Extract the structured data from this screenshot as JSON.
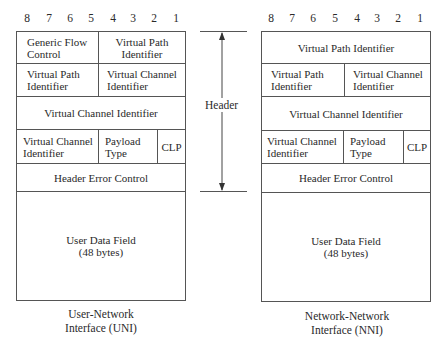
{
  "bit_labels": [
    "8",
    "7",
    "6",
    "5",
    "4",
    "3",
    "2",
    "1"
  ],
  "header_annotation": {
    "label": "Header"
  },
  "uni": {
    "caption_line1": "User-Network",
    "caption_line2": "Interface (UNI)",
    "rows": {
      "r1_left": "Generic Flow Control",
      "r1_right": "Virtual Path Identifier",
      "r2_left": "Virtual Path Identifier",
      "r2_right": "Virtual Channel Identifier",
      "r3": "Virtual Channel Identifier",
      "r4_left": "Virtual Channel Identifier",
      "r4_mid": "Payload Type",
      "r4_right": "CLP",
      "r5": "Header Error Control",
      "data_line1": "User Data Field",
      "data_line2": "(48 bytes)"
    }
  },
  "nni": {
    "caption_line1": "Network-Network",
    "caption_line2": "Interface (NNI)",
    "rows": {
      "r1": "Virtual Path Identifier",
      "r2_left": "Virtual Path Identifier",
      "r2_right": "Virtual Channel Identifier",
      "r3": "Virtual Channel Identifier",
      "r4_left": "Virtual Channel Identifier",
      "r4_mid": "Payload Type",
      "r4_right": "CLP",
      "r5": "Header Error Control",
      "data_line1": "User Data Field",
      "data_line2": "(48 bytes)"
    }
  }
}
